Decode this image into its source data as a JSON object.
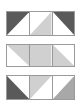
{
  "colors": {
    "dark": "#5a5a5a",
    "light": "#d0d0d0",
    "medium": "#a8a8a8",
    "border": "#9a9a9a",
    "background": "#ffffff"
  },
  "rows": [
    {
      "top": 11,
      "height": 25,
      "cells": [
        {
          "width": 25,
          "fill": "dark",
          "shape": "top-left-triangle",
          "points": "0,0 1,0 0,1"
        },
        {
          "width": 23,
          "fill": "light",
          "shape": "bottom-right-triangle",
          "points": "1,0 1,1 0,1"
        },
        {
          "width": 23,
          "fill": "dark",
          "shape": "top-right-triangle",
          "points": "0,0 1,0 1,1"
        }
      ]
    },
    {
      "top": 44,
      "height": 23,
      "cells": [
        {
          "width": 25,
          "fill": "light",
          "shape": "top-right-triangle",
          "points": "0,0 1,0 1,1"
        },
        {
          "width": 23,
          "fill": "light",
          "shape": "full-square",
          "points": "0,0 1,0 1,1 0,1"
        },
        {
          "width": 23,
          "fill": "light",
          "shape": "bottom-left-triangle",
          "points": "0,0 0,1 1,1"
        }
      ]
    },
    {
      "top": 75,
      "height": 25,
      "cells": [
        {
          "width": 25,
          "fill": "dark",
          "shape": "bottom-left-triangle",
          "points": "0,0 0,1 1,1"
        },
        {
          "width": 23,
          "fill": "light",
          "shape": "top-left-triangle",
          "points": "0,0 1,0 0,1"
        },
        {
          "width": 23,
          "fill": "medium",
          "shape": "bottom-right-triangle",
          "points": "1,0 1,1 0,1"
        }
      ]
    }
  ]
}
